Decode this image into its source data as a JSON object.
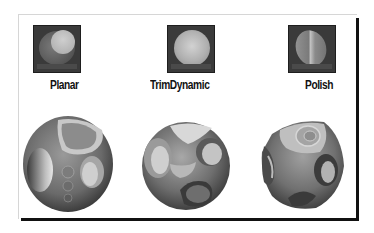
{
  "figure": {
    "materials": [
      {
        "id": "planar",
        "label": "Planar"
      },
      {
        "id": "trimdynamic",
        "label": "TrimDynamic"
      },
      {
        "id": "polish",
        "label": "Polish"
      }
    ],
    "colors": {
      "thumb_bg": "#3a3a3a",
      "frame_shadow": "#111111",
      "frame_border": "#d6d6d6"
    }
  }
}
